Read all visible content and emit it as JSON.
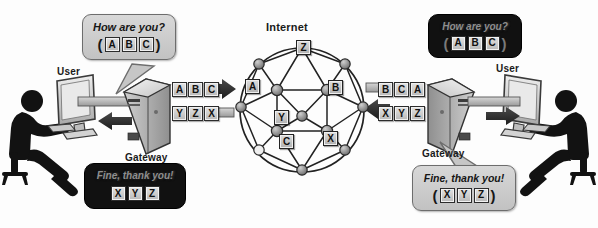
{
  "diagram": {
    "title_internet": "Internet",
    "background": "#fdfdfd",
    "ink": "#1a1a1a"
  },
  "labels": {
    "internet": "Internet",
    "user_left": "User",
    "user_right": "User",
    "gateway_left": "Gateway",
    "gateway_right": "Gateway"
  },
  "bubbles": {
    "top_left": {
      "text": "How are you?",
      "style": "clear",
      "open_paren": "(",
      "close_paren": ")",
      "tiles": [
        "A",
        "B",
        "C"
      ]
    },
    "top_right": {
      "text": "How are you?",
      "style": "encrypted",
      "open_paren": "(",
      "close_paren": ")",
      "tiles": [
        "A",
        "B",
        "C"
      ]
    },
    "bottom_left": {
      "text": "Fine, thank you!",
      "style": "encrypted",
      "open_paren": "",
      "close_paren": "",
      "tiles": [
        "X",
        "Y",
        "Z"
      ]
    },
    "bottom_right": {
      "text": "Fine, thank you!",
      "style": "clear",
      "open_paren": "(",
      "close_paren": ")",
      "tiles": [
        "X",
        "Y",
        "Z"
      ]
    }
  },
  "gateway_left": {
    "label": "Gateway",
    "outbound_tiles": [
      "A",
      "B",
      "C"
    ],
    "inbound_tiles": [
      "Y",
      "Z",
      "X"
    ],
    "outbound_direction": "right",
    "inbound_direction": "left"
  },
  "gateway_right": {
    "label": "Gateway",
    "inbound_tiles": [
      "B",
      "C",
      "A"
    ],
    "outbound_tiles": [
      "X",
      "Y",
      "Z"
    ],
    "inbound_direction": "left",
    "outbound_direction": "right"
  },
  "cloud": {
    "label": "Internet",
    "center_x": 302,
    "center_y": 110,
    "radius": 62,
    "packets": [
      {
        "letter": "Z",
        "x": 303,
        "y": 47
      },
      {
        "letter": "A",
        "x": 252,
        "y": 86
      },
      {
        "letter": "B",
        "x": 335,
        "y": 87
      },
      {
        "letter": "Y",
        "x": 281,
        "y": 117
      },
      {
        "letter": "C",
        "x": 286,
        "y": 141
      },
      {
        "letter": "X",
        "x": 330,
        "y": 138
      }
    ],
    "node_count": 17
  },
  "users": {
    "left": {
      "label": "User",
      "device": "desktop-monitor"
    },
    "right": {
      "label": "User",
      "device": "desktop-monitor"
    }
  },
  "colors": {
    "tile_face": "#d2d2d2",
    "tile_border": "#232323",
    "node_fill": "#8d8d8d",
    "link": "#2a2a2a",
    "bubble_face": "#cfcfcf",
    "encrypted": "#111111"
  }
}
